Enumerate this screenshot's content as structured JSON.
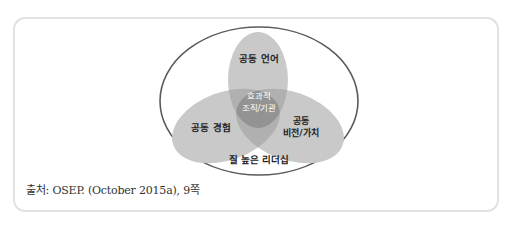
{
  "diagram": {
    "outer_label": "질 높은 리더십",
    "circles": [
      {
        "label": "공동 언어"
      },
      {
        "label": "공동 경험"
      },
      {
        "label_line1": "공동",
        "label_line2": "비전/가치"
      }
    ],
    "center_line1": "효과적",
    "center_line2": "조직/기관",
    "colors": {
      "outer_stroke": "#5a5a5a",
      "lobe_fill": "#c9c9c9",
      "pair_overlap": "#b0b0b0",
      "center_fill": "#939393",
      "center_text": "#ffffff",
      "label_text": "#222222"
    }
  },
  "caption": "출처: OSEP. (October 2015a), 9쪽"
}
